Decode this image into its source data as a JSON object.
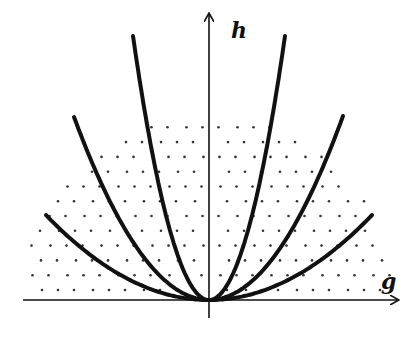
{
  "diagram": {
    "origin": [
      209,
      300
    ],
    "axes": {
      "x": {
        "label": "g",
        "from": 23,
        "to": 398,
        "label_pos": [
          381,
          289
        ]
      },
      "y": {
        "label": "h",
        "from": 318,
        "to": 14,
        "label_pos": [
          231,
          38
        ]
      }
    },
    "curves": [
      {
        "name": "inner",
        "left_end": [
          133,
          36
        ],
        "right_end": [
          285,
          36
        ]
      },
      {
        "name": "middle",
        "left_end": [
          74,
          117
        ],
        "right_end": [
          343,
          116
        ]
      },
      {
        "name": "outer",
        "left_end": [
          46,
          215
        ],
        "right_end": [
          372,
          215
        ]
      }
    ],
    "dotted_region": {
      "shape": "semicircle",
      "center": [
        209,
        300
      ],
      "radius": 185,
      "spacing": 17
    },
    "colors": {
      "stroke": "#111111",
      "dot": "#333333",
      "background": "#ffffff"
    }
  }
}
